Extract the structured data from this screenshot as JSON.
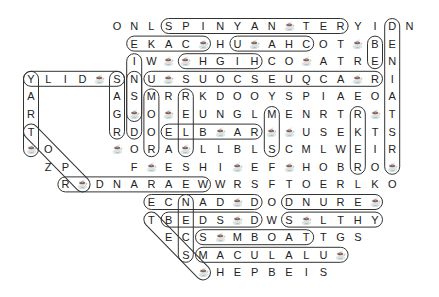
{
  "puzzle": {
    "type": "word-search",
    "grid_origin": {
      "x": 31,
      "y": 26
    },
    "cell_spacing": {
      "x": 17.2,
      "y": 17.6
    },
    "cup_symbol": "☕",
    "rows": [
      {
        "start": 5,
        "letters": [
          "O",
          "N",
          "L",
          "S",
          "P",
          "I",
          "N",
          "Y",
          "A",
          "N",
          "☕",
          "T",
          "E",
          "R",
          "Y",
          "I",
          "D",
          "N"
        ]
      },
      {
        "start": 6,
        "letters": [
          "E",
          "K",
          "A",
          "C",
          "☕",
          "H",
          "U",
          "☕",
          "A",
          "H",
          "C",
          "O",
          "T",
          "☕",
          "B",
          "E"
        ]
      },
      {
        "start": 6,
        "letters": [
          "I",
          "W",
          "☕",
          "☕",
          "H",
          "G",
          "I",
          "H",
          "C",
          "O",
          "☕",
          "A",
          "T",
          "R",
          "E",
          "N"
        ]
      },
      {
        "start": 0,
        "letters": [
          "Y",
          "L",
          "I",
          "D",
          "☕",
          "S",
          "N",
          "U",
          "☕",
          "S",
          "U",
          "O",
          "C",
          "S",
          "E",
          "U",
          "Q",
          "C",
          "A",
          "☕",
          "R",
          "I"
        ]
      },
      {
        "start": 0,
        "letters": [
          "A",
          " ",
          " ",
          " ",
          " ",
          "A",
          "S",
          "M",
          "R",
          "R",
          "K",
          "D",
          "O",
          "O",
          "Y",
          "S",
          "P",
          "I",
          "A",
          "E",
          "O",
          "A"
        ]
      },
      {
        "start": 0,
        "letters": [
          "R",
          " ",
          " ",
          " ",
          " ",
          "G",
          "☕",
          "O",
          "☕",
          "E",
          "U",
          "N",
          "G",
          "L",
          "M",
          "E",
          "N",
          "R",
          "T",
          "R",
          "☕",
          "T"
        ]
      },
      {
        "start": 0,
        "letters": [
          "T",
          " ",
          " ",
          " ",
          " ",
          "R",
          "D",
          "O",
          "E",
          "L",
          "B",
          "☕",
          "A",
          "R",
          "☕",
          "☕",
          "U",
          "S",
          "E",
          "K",
          "T",
          "S"
        ]
      },
      {
        "start": 0,
        "letters": [
          "☕",
          "O",
          " ",
          " ",
          " ",
          "☕",
          "O",
          "R",
          "A",
          "☕",
          "L",
          "L",
          "B",
          "L",
          "S",
          "C",
          "M",
          "L",
          "W",
          "E",
          "I",
          "R"
        ]
      },
      {
        "start": 1,
        "letters": [
          "Z",
          "P",
          " ",
          " ",
          " ",
          "F",
          "☕",
          "E",
          "S",
          "H",
          "I",
          "☕",
          "E",
          "F",
          "☕",
          "H",
          "O",
          "B",
          "R",
          "O",
          "☕"
        ]
      },
      {
        "start": 2,
        "letters": [
          "R",
          "☕",
          "D",
          "N",
          "A",
          "R",
          "A",
          "E",
          "W",
          "W",
          "R",
          "S",
          "F",
          "T",
          "O",
          "E",
          "R",
          "L",
          "K",
          "O"
        ]
      },
      {
        "start": 7,
        "letters": [
          "E",
          "C",
          "N",
          "A",
          "D",
          "☕",
          "D",
          "O",
          "D",
          "N",
          "U",
          "R",
          "E",
          "☕"
        ]
      },
      {
        "start": 7,
        "letters": [
          "T",
          "B",
          "E",
          "D",
          "S",
          "☕",
          "D",
          "W",
          "S",
          "☕",
          "L",
          "T",
          "H",
          "Y"
        ]
      },
      {
        "start": 8,
        "letters": [
          "E",
          "C",
          "S",
          "☕",
          "M",
          "B",
          "O",
          "A",
          "T",
          "T",
          "G",
          "S"
        ]
      },
      {
        "start": 9,
        "letters": [
          "S",
          "M",
          "A",
          "C",
          "U",
          "L",
          "A",
          "L",
          "U",
          "☕"
        ]
      },
      {
        "start": 10,
        "letters": [
          "☕",
          "H",
          "E",
          "P",
          "B",
          "E",
          "I",
          "S"
        ]
      }
    ],
    "found_words": [
      {
        "name": "spinyanter",
        "from": [
          0,
          8
        ],
        "to": [
          0,
          18
        ]
      },
      {
        "name": "ekac",
        "from": [
          1,
          6
        ],
        "to": [
          1,
          10
        ]
      },
      {
        "name": "uahc",
        "from": [
          1,
          12
        ],
        "to": [
          1,
          16
        ]
      },
      {
        "name": "hgih",
        "from": [
          2,
          9
        ],
        "to": [
          2,
          13
        ]
      },
      {
        "name": "ylidsnu",
        "from": [
          3,
          0
        ],
        "to": [
          3,
          5
        ]
      },
      {
        "name": "usuocseuqca",
        "from": [
          3,
          7
        ],
        "to": [
          3,
          20
        ]
      },
      {
        "name": "elbar",
        "from": [
          6,
          8
        ],
        "to": [
          6,
          13
        ]
      },
      {
        "name": "rdnaraew",
        "from": [
          9,
          2
        ],
        "to": [
          9,
          10
        ]
      },
      {
        "name": "ecnad",
        "from": [
          10,
          7
        ],
        "to": [
          10,
          13
        ]
      },
      {
        "name": "dnure",
        "from": [
          10,
          15
        ],
        "to": [
          10,
          20
        ]
      },
      {
        "name": "tbedsd",
        "from": [
          11,
          8
        ],
        "to": [
          11,
          13
        ]
      },
      {
        "name": "slthy",
        "from": [
          11,
          15
        ],
        "to": [
          11,
          20
        ]
      },
      {
        "name": "smboat",
        "from": [
          12,
          10
        ],
        "to": [
          12,
          16
        ]
      },
      {
        "name": "macalau",
        "from": [
          13,
          10
        ],
        "to": [
          13,
          18
        ]
      },
      {
        "name": "deniatsr",
        "from": [
          0,
          21
        ],
        "to": [
          8,
          21
        ]
      },
      {
        "name": "yart",
        "from": [
          3,
          0
        ],
        "to": [
          7,
          0
        ]
      },
      {
        "name": "sagr",
        "from": [
          3,
          5
        ],
        "to": [
          6,
          5
        ]
      },
      {
        "name": "nsd",
        "from": [
          3,
          6
        ],
        "to": [
          6,
          6
        ]
      },
      {
        "name": "moo",
        "from": [
          4,
          7
        ],
        "to": [
          7,
          7
        ]
      },
      {
        "name": "ruef",
        "from": [
          4,
          9
        ],
        "to": [
          7,
          9
        ]
      },
      {
        "name": "rekr",
        "from": [
          5,
          19
        ],
        "to": [
          8,
          19
        ]
      },
      {
        "name": "iwcohcs",
        "from": [
          2,
          6
        ],
        "to": [
          5,
          6
        ]
      },
      {
        "name": "col-b",
        "from": [
          1,
          20
        ],
        "to": [
          2,
          20
        ]
      },
      {
        "name": "mul",
        "from": [
          5,
          14
        ],
        "to": [
          7,
          14
        ]
      },
      {
        "name": "tesm",
        "from": [
          11,
          7
        ],
        "to": [
          14,
          10
        ]
      },
      {
        "name": "diag-tozp",
        "from": [
          6,
          0
        ],
        "to": [
          9,
          3
        ]
      },
      {
        "name": "ncs",
        "from": [
          10,
          9
        ],
        "to": [
          13,
          9
        ]
      }
    ]
  }
}
